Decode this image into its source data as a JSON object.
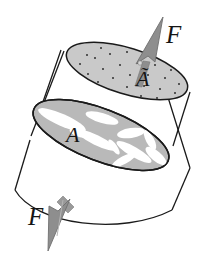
{
  "figure": {
    "background_color": "#ffffff",
    "width": 202,
    "height": 257,
    "labels": {
      "force_top": "F",
      "force_bottom": "F",
      "area_effective": "Ã",
      "area_nominal": "A"
    },
    "colors": {
      "outline": "#1a1a1a",
      "arrow_fill": "#8e8e8e",
      "arrow_stroke": "#6f6f6f",
      "top_face_fill": "#c9c9c9",
      "mid_face_fill": "#b9b9b9",
      "void_fill": "#ffffff",
      "dot_color": "#3a3a3a",
      "text_color": "#151515"
    },
    "elements": [
      {
        "name": "cylinder-body",
        "type": "cylinder",
        "description": "tilted cylindrical bar outline"
      },
      {
        "name": "top-face",
        "type": "ellipse",
        "description": "upper cross-section, stippled with dots",
        "label": "Ã"
      },
      {
        "name": "mid-face",
        "type": "ellipse",
        "description": "lower cross-section with white void streaks",
        "label": "A"
      },
      {
        "name": "force-arrow-top",
        "type": "arrow",
        "direction": "up-right",
        "label": "F"
      },
      {
        "name": "force-arrow-bottom",
        "type": "arrow",
        "direction": "down-left",
        "label": "F"
      }
    ],
    "top_face_dots": [
      [
        87,
        55
      ],
      [
        101,
        48
      ],
      [
        118,
        44
      ],
      [
        136,
        42
      ],
      [
        153,
        44
      ],
      [
        170,
        49
      ],
      [
        80,
        64
      ],
      [
        95,
        58
      ],
      [
        110,
        54
      ],
      [
        127,
        52
      ],
      [
        145,
        53
      ],
      [
        161,
        57
      ],
      [
        176,
        62
      ],
      [
        88,
        74
      ],
      [
        103,
        69
      ],
      [
        120,
        65
      ],
      [
        138,
        63
      ],
      [
        155,
        65
      ],
      [
        171,
        70
      ],
      [
        183,
        76
      ],
      [
        98,
        82
      ],
      [
        113,
        78
      ],
      [
        130,
        75
      ],
      [
        148,
        75
      ],
      [
        165,
        78
      ],
      [
        179,
        84
      ],
      [
        110,
        90
      ],
      [
        127,
        87
      ],
      [
        144,
        86
      ],
      [
        160,
        89
      ],
      [
        175,
        93
      ],
      [
        125,
        97
      ],
      [
        141,
        96
      ],
      [
        157,
        98
      ]
    ]
  }
}
